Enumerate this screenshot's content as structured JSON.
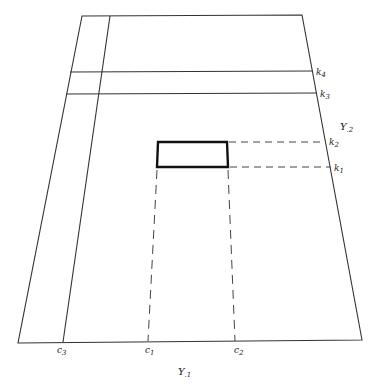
{
  "diagram": {
    "outline": {
      "top_left": [
        82,
        16
      ],
      "top_right": [
        302,
        15
      ],
      "bottom_right": [
        362,
        340
      ],
      "bottom_left": [
        18,
        343
      ]
    },
    "inner_vertical": {
      "from": [
        110,
        16
      ],
      "to": [
        63,
        342
      ]
    },
    "horizontal_lines": [
      {
        "id": "k4",
        "from": [
          70,
          72
        ],
        "to": [
          313,
          71
        ]
      },
      {
        "id": "k3",
        "from": [
          66,
          94
        ],
        "to": [
          317,
          93
        ]
      }
    ],
    "bold_rectangle": {
      "points": [
        [
          158,
          142
        ],
        [
          227,
          142
        ],
        [
          228,
          167
        ],
        [
          157,
          167
        ]
      ]
    },
    "dashed_lines": [
      {
        "id": "k2",
        "from": [
          227,
          142
        ],
        "to": [
          326,
          142
        ]
      },
      {
        "id": "k1",
        "from": [
          228,
          167
        ],
        "to": [
          331,
          167
        ]
      },
      {
        "id": "c1",
        "from": [
          157,
          167
        ],
        "to": [
          148,
          341
        ]
      },
      {
        "id": "c2",
        "from": [
          228,
          167
        ],
        "to": [
          235,
          341
        ]
      }
    ],
    "labels": {
      "k4": {
        "base": "k",
        "sub": "4",
        "x": 316,
        "y": 75
      },
      "k3": {
        "base": "k",
        "sub": "3",
        "x": 320,
        "y": 97
      },
      "k2": {
        "base": "k",
        "sub": "2",
        "x": 329,
        "y": 145
      },
      "k1": {
        "base": "k",
        "sub": "1",
        "x": 334,
        "y": 171
      },
      "y2": {
        "base": "Y",
        "sub": ".2",
        "x": 340,
        "y": 130
      },
      "c3": {
        "base": "c",
        "sub": "3",
        "x": 57,
        "y": 353
      },
      "c1": {
        "base": "c",
        "sub": "1",
        "x": 145,
        "y": 353
      },
      "c2": {
        "base": "c",
        "sub": "2",
        "x": 234,
        "y": 353
      },
      "y1": {
        "base": "Y",
        "sub": ".1",
        "x": 178,
        "y": 375
      }
    }
  }
}
